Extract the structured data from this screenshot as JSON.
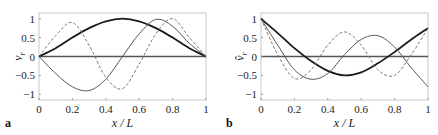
{
  "chart_data": [
    {
      "panel": "a",
      "type": "line",
      "title": "",
      "xlabel": "x / L",
      "ylabel": "v_r",
      "xlim": [
        0,
        1
      ],
      "ylim": [
        -1.15,
        1.15
      ],
      "xticks": [
        "0",
        "0.2",
        "0.4",
        "0.6",
        "0.8",
        "1"
      ],
      "yticks": [
        "1",
        "0.5",
        "0",
        "-0.5",
        "-1"
      ],
      "grid": false,
      "legend": null,
      "x": [
        0,
        0.1,
        0.2,
        0.3,
        0.4,
        0.5,
        0.6,
        0.7,
        0.8,
        0.9,
        1.0
      ],
      "series": [
        {
          "name": "mode 1 (thick solid)",
          "style": "thick-solid",
          "values": [
            0,
            0.22,
            0.5,
            0.75,
            0.93,
            1.0,
            0.93,
            0.75,
            0.5,
            0.22,
            0
          ]
        },
        {
          "name": "mode 2 (thin solid)",
          "style": "thin-solid",
          "values": [
            0,
            -0.45,
            -0.8,
            -0.9,
            -0.6,
            0.0,
            0.6,
            0.98,
            0.8,
            0.35,
            0
          ]
        },
        {
          "name": "mode 3 (dashed)",
          "style": "dashed",
          "values": [
            0,
            0.55,
            0.9,
            0.3,
            -0.55,
            -0.85,
            -0.2,
            0.6,
            1.0,
            0.5,
            0
          ]
        }
      ]
    },
    {
      "panel": "b",
      "type": "line",
      "title": "",
      "xlabel": "x / L",
      "ylabel": "v̂_r",
      "xlim": [
        0,
        1
      ],
      "ylim": [
        -1.15,
        1.15
      ],
      "xticks": [
        "0",
        "0.2",
        "0.4",
        "0.6",
        "0.8",
        "1"
      ],
      "yticks": [
        "1",
        "0.5",
        "0",
        "-0.5",
        "-1"
      ],
      "grid": false,
      "legend": null,
      "x": [
        0,
        0.1,
        0.2,
        0.3,
        0.4,
        0.5,
        0.6,
        0.7,
        0.8,
        0.9,
        1.0
      ],
      "series": [
        {
          "name": "mode 1 (thick solid)",
          "style": "thick-solid",
          "values": [
            1.0,
            0.62,
            0.22,
            -0.12,
            -0.38,
            -0.5,
            -0.42,
            -0.18,
            0.12,
            0.45,
            0.75
          ]
        },
        {
          "name": "mode 2 (thin solid)",
          "style": "thin-solid",
          "values": [
            1.0,
            0.3,
            -0.35,
            -0.6,
            -0.45,
            0.05,
            0.45,
            0.55,
            0.25,
            -0.3,
            -0.8
          ]
        },
        {
          "name": "mode 3 (dashed)",
          "style": "dashed",
          "values": [
            1.0,
            0.05,
            -0.58,
            -0.35,
            0.3,
            0.65,
            0.3,
            -0.35,
            -0.5,
            0.05,
            0.75
          ]
        }
      ]
    }
  ],
  "panels": {
    "a": {
      "label": "a",
      "ylabel_main": "v",
      "ylabel_sub": "r",
      "xlabel": "x / L"
    },
    "b": {
      "label": "b",
      "ylabel_main": "v̂",
      "ylabel_sub": "r",
      "xlabel": "x / L"
    }
  },
  "colors": {
    "thick": "#1a1a1a",
    "thin": "#555555",
    "dashed": "#777777",
    "zero_line": "#555555",
    "frame": "#c8c8c8"
  }
}
